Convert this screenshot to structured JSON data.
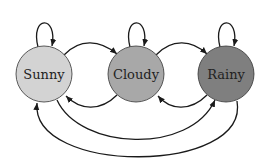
{
  "diagram": {
    "type": "state-transition",
    "states": [
      {
        "id": "sunny",
        "label": "Sunny",
        "color": "#d3d3d3"
      },
      {
        "id": "cloudy",
        "label": "Cloudy",
        "color": "#a8a8a8"
      },
      {
        "id": "rainy",
        "label": "Rainy",
        "color": "#7f7f7f"
      }
    ],
    "transitions": [
      {
        "from": "Sunny",
        "to": "Sunny"
      },
      {
        "from": "Cloudy",
        "to": "Cloudy"
      },
      {
        "from": "Rainy",
        "to": "Rainy"
      },
      {
        "from": "Sunny",
        "to": "Cloudy"
      },
      {
        "from": "Cloudy",
        "to": "Sunny"
      },
      {
        "from": "Cloudy",
        "to": "Rainy"
      },
      {
        "from": "Rainy",
        "to": "Cloudy"
      },
      {
        "from": "Sunny",
        "to": "Rainy"
      },
      {
        "from": "Rainy",
        "to": "Sunny"
      }
    ]
  }
}
